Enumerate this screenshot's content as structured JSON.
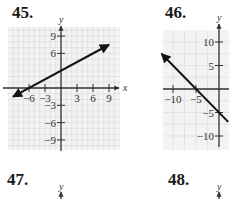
{
  "problems": [
    {
      "label": "45."
    },
    {
      "label": "46."
    },
    {
      "label": "47."
    },
    {
      "label": "48."
    }
  ],
  "chart_data": [
    {
      "type": "line",
      "title": "45.",
      "xlabel": "x",
      "ylabel": "y",
      "xlim": [
        -10,
        10.5
      ],
      "ylim": [
        -10.5,
        10.5
      ],
      "grid": true,
      "xticks": [
        -6,
        -3,
        3,
        6,
        9
      ],
      "xtick_labels": [
        "−6",
        "−3",
        "3",
        "6",
        "9"
      ],
      "yticks": [
        9,
        6,
        -3,
        -6,
        -9
      ],
      "ytick_labels": [
        "9",
        "6",
        "−3",
        "−6",
        "−9"
      ],
      "series": [
        {
          "name": "line",
          "x": [
            -9,
            9
          ],
          "y": [
            -1.5,
            7.5
          ],
          "arrows": "both"
        }
      ]
    },
    {
      "type": "line",
      "title": "46.",
      "xlabel": "x",
      "ylabel": "y",
      "xlim": [
        -13,
        3
      ],
      "ylim": [
        -12,
        12
      ],
      "grid": true,
      "xticks": [
        -10,
        -5
      ],
      "xtick_labels": [
        "−10",
        "−5"
      ],
      "yticks": [
        10,
        5,
        -5,
        -10
      ],
      "ytick_labels": [
        "10",
        "5",
        "−5",
        "−10"
      ],
      "series": [
        {
          "name": "line",
          "x": [
            -12.5,
            2
          ],
          "y": [
            7.5,
            -7
          ],
          "arrows": "start"
        }
      ]
    },
    {
      "type": "line",
      "title": "47.",
      "ylabel": "y",
      "series": []
    },
    {
      "type": "line",
      "title": "48.",
      "ylabel": "y",
      "series": []
    }
  ]
}
